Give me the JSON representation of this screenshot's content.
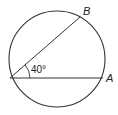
{
  "diagram": {
    "type": "circle-inscribed-angle",
    "points": [
      {
        "label": "B"
      },
      {
        "label": "A"
      }
    ],
    "angle_label": "40°",
    "colors": {
      "stroke": "#333333",
      "background": "#ffffff"
    }
  }
}
